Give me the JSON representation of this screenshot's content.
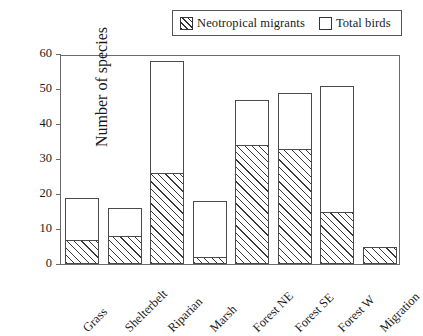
{
  "chart_data": {
    "type": "bar",
    "title": "",
    "xlabel": "",
    "ylabel": "Number of species",
    "ylim": [
      0,
      60
    ],
    "yticks": [
      0,
      10,
      20,
      30,
      40,
      50,
      60
    ],
    "grid": false,
    "legend_position": "top-right",
    "bar_style": "overlaid",
    "categories": [
      "Grass",
      "Shelterbelt",
      "Riparian",
      "Marsh",
      "Forest NE",
      "Forest SE",
      "Forest W",
      "Migration"
    ],
    "series": [
      {
        "name": "Total birds",
        "fill": "white",
        "values": [
          19,
          16,
          58,
          18,
          47,
          49,
          51,
          5
        ]
      },
      {
        "name": "Neotropical migrants",
        "fill": "hatched",
        "values": [
          7,
          8,
          26,
          2,
          34,
          33,
          15,
          5
        ]
      }
    ]
  },
  "legend": {
    "items": [
      {
        "label": "Neotropical migrants",
        "swatch": "hatched"
      },
      {
        "label": "Total birds",
        "swatch": "white"
      }
    ]
  },
  "colors": {
    "frame": "#6a6a6a",
    "bar_outline": "#4a4a4a",
    "hatch": "#3a3a3a",
    "background": "#ffffff",
    "text": "#1a1a1a"
  }
}
